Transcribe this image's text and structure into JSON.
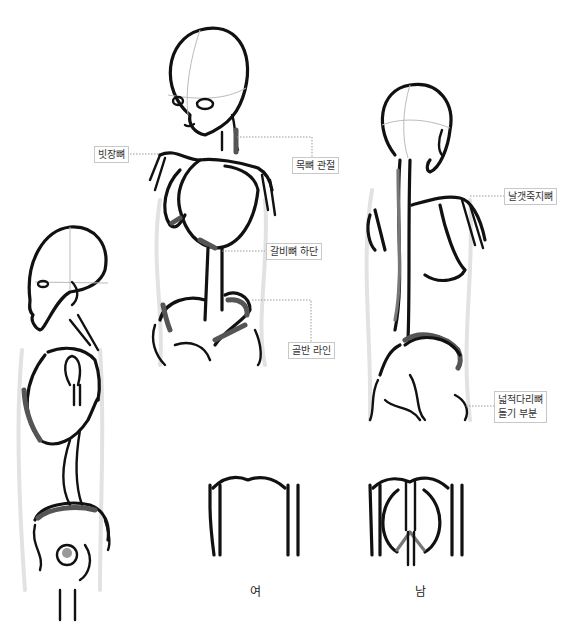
{
  "labels": {
    "clavicle": "빗장뼈",
    "neck_joint": "목뼈 관절",
    "rib_bottom": "갈비뼈 하단",
    "pelvis_line": "골반 라인",
    "scapula": "날갯죽지뼈",
    "femur_line1": "넓적다리뼈",
    "femur_line2": "돌기 부분"
  },
  "captions": {
    "female": "여",
    "male": "남"
  },
  "colors": {
    "ink": "#111111",
    "shade": "#555555",
    "guide": "#bbbbbb",
    "label_border": "#c8c8c8"
  }
}
